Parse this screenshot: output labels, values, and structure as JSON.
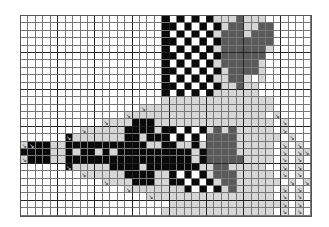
{
  "chart_title": "",
  "grid": {
    "cols": 39,
    "rows": 27,
    "legend": {
      ".": "white",
      "l": "light-gray",
      "b": "black",
      "d": "dark-gray",
      "a": "light-gray-with-arrow-mark",
      "m": "white-with-arrow-mark",
      "k": "black-with-arrow-mark"
    },
    "arrow_glyph": "↘",
    "colors": {
      "white": "#ffffff",
      "light_gray": "#d6d6d6",
      "dark_gray": "#5a5a5a",
      "black": "#0a0a0a"
    },
    "cells": [
      "...................b.b.b.bllldlll......",
      "...................bb.b.b.blddlldd.....",
      "...................b.b.b.bldddlddd.....",
      "...................bb.b.b.bddddddd.....",
      "...................b.b.b.blddddddl.....",
      "...................bb.b.b.bdddddd......",
      "...................b.b.b.bldddddl......",
      "...................bb.b.b.blddddl......",
      "...................b.b.b.bllddl.l......",
      "...................bb.b.b.blldll.......",
      "...................b.b.b.bllllll.......",
      "...................lllllllllllllll.....",
      "................alllllllllllllllll.....",
      "..............allllllllllllllllll.a....",
      "...........alllbbbllllllllllllllll.a...",
      "........alllllbbbblbb.b.bldldlllll.a...",
      "......klllllllbblbbb.b.b.ddddllllll.a..",
      "akbbllbbbbbbbbbbbllbbllblddddlllll.a.a.",
      "bbbbllblbblblbbbbbbbbbblbddddlllll.a.aa",
      "abbbllbbbbbbbbbbbbbbbbblbdddddllll.a.a.",
      "......klllllbbbblbbbbbbbllddlllll..a.a.",
      "........alllllbbbbllb.b.bldddlllll.a.a.",
      "...........alllbbbllbb.b.blddllllll.a.a",
      "..............alllllllb.b.bldlllll.a.a.",
      ".................allllllllllllllll.a.a.",
      "....................llllllllllllllla.a.",
      "...................lllllllllllllll.a.a."
    ]
  }
}
